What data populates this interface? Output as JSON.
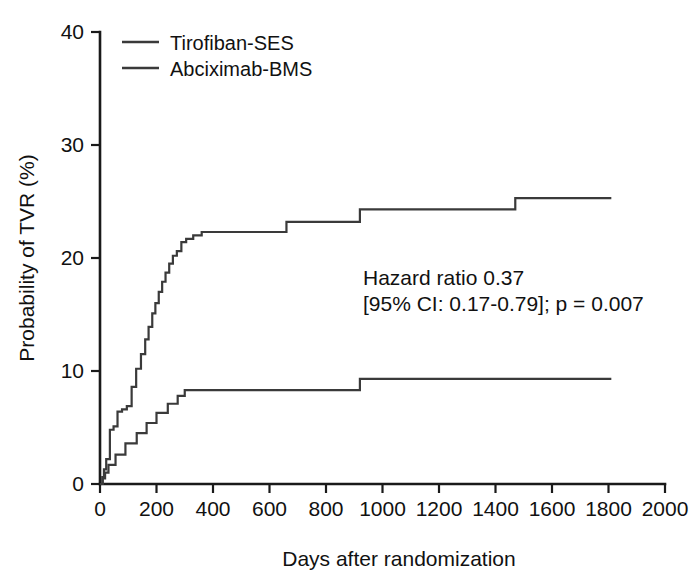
{
  "chart_data": {
    "type": "line",
    "title": "",
    "subtitle": "",
    "xlabel": "Days after randomization",
    "ylabel": "Probability of TVR (%)",
    "xlim": [
      0,
      2000
    ],
    "ylim": [
      0,
      40
    ],
    "xticks": [
      0,
      200,
      400,
      600,
      800,
      1000,
      1200,
      1400,
      1600,
      1800,
      2000
    ],
    "xtick_labels": [
      "0",
      "200",
      "400",
      "600",
      "800",
      "1000",
      "1200",
      "1400",
      "1600",
      "1800",
      "2000"
    ],
    "yticks": [
      0,
      10,
      20,
      30,
      40
    ],
    "ytick_labels": [
      "0",
      "10",
      "20",
      "30",
      "40"
    ],
    "grid": false,
    "legend_position": "top-left",
    "step_type": "post",
    "series": [
      {
        "name": "Tirofiban-SES",
        "color": "#3a3a3a",
        "x": [
          0,
          10,
          18,
          30,
          55,
          90,
          130,
          165,
          200,
          240,
          275,
          300,
          920,
          1810
        ],
        "values": [
          0,
          0.5,
          1.0,
          1.7,
          2.6,
          3.6,
          4.5,
          5.4,
          6.3,
          7.1,
          7.8,
          8.3,
          9.3,
          9.3
        ]
      },
      {
        "name": "Abciximab-BMS",
        "color": "#3a3a3a",
        "x": [
          0,
          8,
          14,
          22,
          35,
          48,
          62,
          78,
          95,
          112,
          128,
          145,
          160,
          172,
          185,
          196,
          208,
          220,
          232,
          245,
          258,
          272,
          288,
          305,
          330,
          360,
          400,
          660,
          920,
          1470,
          1810
        ],
        "values": [
          0,
          0.6,
          1.3,
          2.2,
          4.8,
          5.1,
          6.4,
          6.6,
          6.9,
          8.6,
          10.2,
          11.5,
          12.8,
          13.9,
          15.1,
          16.0,
          17.0,
          17.9,
          18.7,
          19.5,
          20.2,
          20.6,
          21.4,
          21.7,
          22.0,
          22.3,
          22.3,
          23.2,
          24.3,
          25.3,
          25.3
        ]
      }
    ],
    "annotations": [
      {
        "text": "Hazard ratio 0.37",
        "x": 1200,
        "y": 16.5
      },
      {
        "text": "[95% CI: 0.17-0.79]; p = 0.007",
        "x": 1200,
        "y": 14.8
      }
    ]
  },
  "legend": {
    "items": [
      {
        "label": "Tirofiban-SES"
      },
      {
        "label": "Abciximab-BMS"
      }
    ]
  },
  "axes": {
    "x_title": "Days after randomization",
    "y_title": "Probability of TVR (%)"
  },
  "annotation": {
    "line1": "Hazard ratio 0.37",
    "line2": "[95% CI: 0.17-0.79]; p = 0.007"
  },
  "colors": {
    "curve": "#3a3a3a",
    "axis": "#1a1a1a",
    "text": "#111111",
    "background": "#ffffff"
  }
}
